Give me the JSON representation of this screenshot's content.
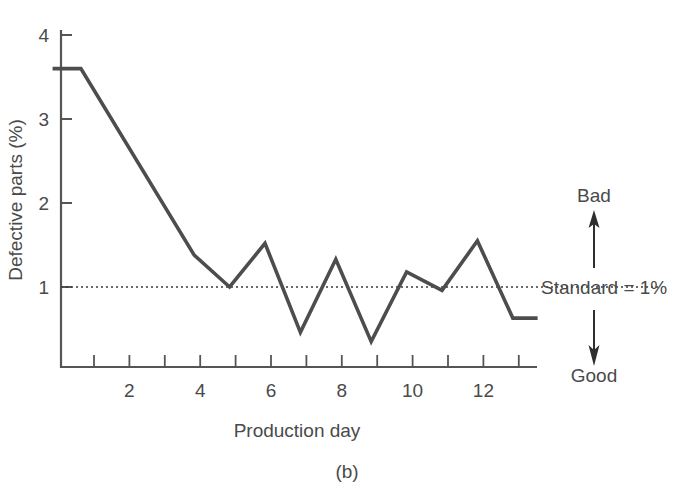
{
  "chart_data": {
    "type": "line",
    "title": "",
    "subtitle": "",
    "xlabel": "Production day",
    "ylabel": "Defective parts (%)",
    "xlim": [
      0,
      13.7
    ],
    "ylim": [
      0.05,
      4.15
    ],
    "grid": false,
    "legend_position": "none",
    "x_ticks": [
      1,
      2,
      3,
      4,
      5,
      6,
      7,
      8,
      9,
      10,
      11,
      12,
      13
    ],
    "x_tick_labels": [
      "",
      "2",
      "",
      "4",
      "",
      "6",
      "",
      "8",
      "",
      "10",
      "",
      "12",
      ""
    ],
    "y_ticks": [
      1,
      2,
      3,
      4
    ],
    "y_tick_labels": [
      "1",
      "2",
      "3",
      "4"
    ],
    "series": [
      {
        "name": "Defective parts",
        "color": "#4d4d4d",
        "x": [
          0,
          0.8,
          4,
          5,
          6,
          7,
          8,
          9,
          10,
          11,
          12,
          13,
          13.7
        ],
        "values": [
          3.6,
          3.6,
          1.38,
          1.0,
          1.52,
          0.46,
          1.33,
          0.35,
          1.18,
          0.96,
          1.55,
          0.63,
          0.63
        ]
      }
    ],
    "reference_line": {
      "label": "Standard = 1%",
      "value": 1,
      "style": "dotted",
      "color": "#3a3a3a"
    },
    "annotations": {
      "up_label": "Bad",
      "down_label": "Good",
      "reference_label": "Standard = 1%"
    },
    "caption": "(b)"
  },
  "colors": {
    "line": "#4d4d4d",
    "axis": "#555555",
    "text": "#4a4a4a",
    "background": "#ffffff"
  },
  "axis": {
    "y_label": "Defective parts (%)",
    "x_label": "Production day"
  },
  "figure": {
    "caption": "(b)"
  }
}
